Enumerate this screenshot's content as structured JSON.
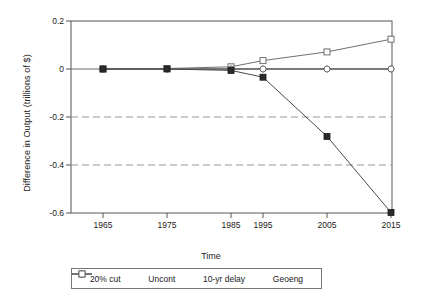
{
  "chart_data": {
    "type": "line",
    "title": "",
    "xlabel": "Time",
    "ylabel": "Difference in Output (trillions of $)",
    "x": [
      1965,
      1975,
      1985,
      1995,
      2005,
      2015
    ],
    "xtick_labels": [
      "1965",
      "1975",
      "1985",
      "1995",
      "2005",
      "2015"
    ],
    "ytick_labels": [
      "0.2",
      "0",
      "-0.2",
      "-0.4",
      "-0.6"
    ],
    "ytick_values": [
      0.2,
      0,
      -0.2,
      -0.4,
      -0.6
    ],
    "xlim": [
      1960,
      2020
    ],
    "ylim": [
      -0.6,
      0.2
    ],
    "grid": "horizontal-dashed-at-minus-0.2-and-minus-0.4",
    "legend_position": "bottom-outside",
    "series": [
      {
        "name": "20% cut",
        "marker": "filled-square",
        "color": "#2b2b2b",
        "values": [
          0.0,
          0.0,
          -0.006,
          -0.034,
          -0.281,
          -0.598
        ]
      },
      {
        "name": "Uncont",
        "marker": "plus",
        "color": "#555555",
        "values": [
          0.0,
          0.0,
          0.0,
          0.0,
          0.0,
          0.0
        ]
      },
      {
        "name": "10-yr delay",
        "marker": "open-circle",
        "color": "#555555",
        "values": [
          0.0,
          0.0,
          0.0,
          0.0,
          0.0,
          0.0
        ]
      },
      {
        "name": "Geoeng",
        "marker": "open-square",
        "color": "#6e6e6e",
        "values": [
          0.0,
          0.002,
          0.009,
          0.035,
          0.071,
          0.124
        ]
      }
    ]
  },
  "legend": {
    "items": [
      {
        "label": "20% cut",
        "marker": "filled-square"
      },
      {
        "label": "Uncont",
        "marker": "plus"
      },
      {
        "label": "10-yr delay",
        "marker": "open-circle"
      },
      {
        "label": "Geoeng",
        "marker": "open-square"
      }
    ]
  },
  "colors": {
    "axis": "#555555",
    "grid": "#9a9a9a",
    "background": "#ffffff",
    "text": "#1a1a1a"
  }
}
